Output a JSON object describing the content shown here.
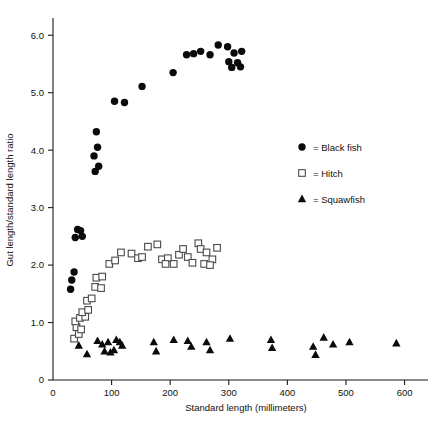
{
  "chart_data": {
    "type": "scatter",
    "title": "",
    "xlabel": "Standard length (millimeters)",
    "ylabel": "Gut length/standard length ratio",
    "xlim": [
      0,
      640
    ],
    "ylim": [
      0,
      6.3
    ],
    "xticks": [
      0,
      100,
      200,
      300,
      400,
      500,
      600
    ],
    "xticklabels": [
      "0",
      "100",
      "200",
      "300",
      "400",
      "500",
      "600"
    ],
    "yticks": [
      0,
      1.0,
      2.0,
      3.0,
      4.0,
      5.0,
      6.0
    ],
    "yticklabels": [
      "0",
      "1.0",
      "2.0",
      "3.0",
      "4.0",
      "5.0",
      "6.0"
    ],
    "grid": false,
    "legend_position": "right-middle",
    "legend": [
      {
        "marker": "circle",
        "label": "= Black fish"
      },
      {
        "marker": "square",
        "label": "= Hitch"
      },
      {
        "marker": "triangle",
        "label": "= Squawfish"
      }
    ],
    "series": [
      {
        "name": "Black fish",
        "marker": "circle",
        "points": [
          [
            42,
            2.62
          ],
          [
            38,
            2.48
          ],
          [
            50,
            2.5
          ],
          [
            47,
            2.6
          ],
          [
            36,
            1.88
          ],
          [
            32,
            1.74
          ],
          [
            30,
            1.58
          ],
          [
            72,
            3.63
          ],
          [
            70,
            3.9
          ],
          [
            78,
            3.72
          ],
          [
            76,
            4.05
          ],
          [
            74,
            4.32
          ],
          [
            105,
            4.85
          ],
          [
            122,
            4.83
          ],
          [
            152,
            5.11
          ],
          [
            205,
            5.35
          ],
          [
            252,
            5.72
          ],
          [
            268,
            5.66
          ],
          [
            282,
            5.83
          ],
          [
            298,
            5.8
          ],
          [
            309,
            5.69
          ],
          [
            322,
            5.72
          ],
          [
            300,
            5.54
          ],
          [
            315,
            5.52
          ],
          [
            305,
            5.44
          ],
          [
            320,
            5.45
          ],
          [
            240,
            5.68
          ],
          [
            228,
            5.66
          ]
        ]
      },
      {
        "name": "Hitch",
        "marker": "square",
        "points": [
          [
            36,
            0.72
          ],
          [
            44,
            0.8
          ],
          [
            40,
            0.92
          ],
          [
            48,
            0.88
          ],
          [
            38,
            1.02
          ],
          [
            46,
            1.08
          ],
          [
            55,
            1.1
          ],
          [
            50,
            1.18
          ],
          [
            60,
            1.22
          ],
          [
            58,
            1.38
          ],
          [
            66,
            1.42
          ],
          [
            72,
            1.62
          ],
          [
            82,
            1.6
          ],
          [
            74,
            1.78
          ],
          [
            84,
            1.8
          ],
          [
            96,
            2.02
          ],
          [
            106,
            2.08
          ],
          [
            116,
            2.22
          ],
          [
            134,
            2.2
          ],
          [
            145,
            2.12
          ],
          [
            152,
            2.14
          ],
          [
            162,
            2.32
          ],
          [
            178,
            2.36
          ],
          [
            186,
            2.1
          ],
          [
            196,
            2.12
          ],
          [
            192,
            2.02
          ],
          [
            206,
            2.02
          ],
          [
            215,
            2.18
          ],
          [
            222,
            2.28
          ],
          [
            230,
            2.14
          ],
          [
            238,
            2.04
          ],
          [
            248,
            2.38
          ],
          [
            252,
            2.28
          ],
          [
            262,
            2.22
          ],
          [
            272,
            2.1
          ],
          [
            258,
            2.02
          ],
          [
            268,
            2.0
          ],
          [
            280,
            2.3
          ]
        ]
      },
      {
        "name": "Squawfish",
        "marker": "triangle",
        "points": [
          [
            44,
            0.6
          ],
          [
            58,
            0.45
          ],
          [
            76,
            0.68
          ],
          [
            84,
            0.62
          ],
          [
            88,
            0.5
          ],
          [
            94,
            0.66
          ],
          [
            98,
            0.48
          ],
          [
            104,
            0.52
          ],
          [
            108,
            0.7
          ],
          [
            114,
            0.66
          ],
          [
            118,
            0.6
          ],
          [
            172,
            0.66
          ],
          [
            176,
            0.5
          ],
          [
            206,
            0.7
          ],
          [
            230,
            0.68
          ],
          [
            236,
            0.58
          ],
          [
            262,
            0.66
          ],
          [
            268,
            0.52
          ],
          [
            302,
            0.72
          ],
          [
            372,
            0.7
          ],
          [
            374,
            0.56
          ],
          [
            444,
            0.58
          ],
          [
            448,
            0.44
          ],
          [
            462,
            0.74
          ],
          [
            478,
            0.62
          ],
          [
            506,
            0.66
          ],
          [
            586,
            0.64
          ]
        ]
      }
    ]
  }
}
